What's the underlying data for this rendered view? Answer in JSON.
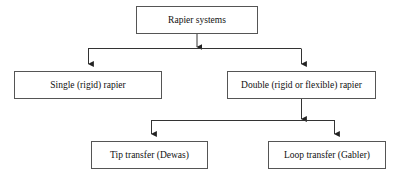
{
  "diagram": {
    "title": "Rapier systems",
    "type": "hierarchy-flowchart",
    "canvas": {
      "width": 402,
      "height": 176,
      "background": "#ffffff"
    },
    "style": {
      "box_border_color": "#555555",
      "box_fill_color": "#ffffff",
      "connector_color": "#333333",
      "text_color": "#101010"
    },
    "nodes": [
      {
        "id": "root",
        "label": "Rapier systems",
        "level": 0,
        "x": 136,
        "y": 6,
        "width": 122,
        "height": 28,
        "font_size": 9.5
      },
      {
        "id": "single",
        "label": "Single (rigid) rapier",
        "level": 1,
        "x": 14,
        "y": 71,
        "width": 148,
        "height": 28,
        "font_size": 9.5
      },
      {
        "id": "double",
        "label": "Double (rigid or flexible) rapier",
        "level": 1,
        "x": 227,
        "y": 71,
        "width": 149,
        "height": 28,
        "font_size": 9.5
      },
      {
        "id": "tip",
        "label": "Tip transfer (Dewas)",
        "level": 2,
        "x": 91,
        "y": 141,
        "width": 117,
        "height": 28,
        "font_size": 9.5
      },
      {
        "id": "loop",
        "label": "Loop transfer (Gabler)",
        "level": 2,
        "x": 268,
        "y": 141,
        "width": 118,
        "height": 28,
        "font_size": 9.5
      }
    ],
    "edges": [
      {
        "id": "edge-root-split",
        "from": "root",
        "to": "split-bar-1",
        "arrow": true
      },
      {
        "id": "edge-root-single",
        "from": "root",
        "to": "single",
        "arrow": true
      },
      {
        "id": "edge-root-double",
        "from": "root",
        "to": "double",
        "arrow": true
      },
      {
        "id": "edge-double-split",
        "from": "double",
        "to": "split-bar-2",
        "arrow": true
      },
      {
        "id": "edge-double-tip",
        "from": "double",
        "to": "tip",
        "arrow": true
      },
      {
        "id": "edge-double-loop",
        "from": "double",
        "to": "loop",
        "arrow": true
      }
    ]
  }
}
